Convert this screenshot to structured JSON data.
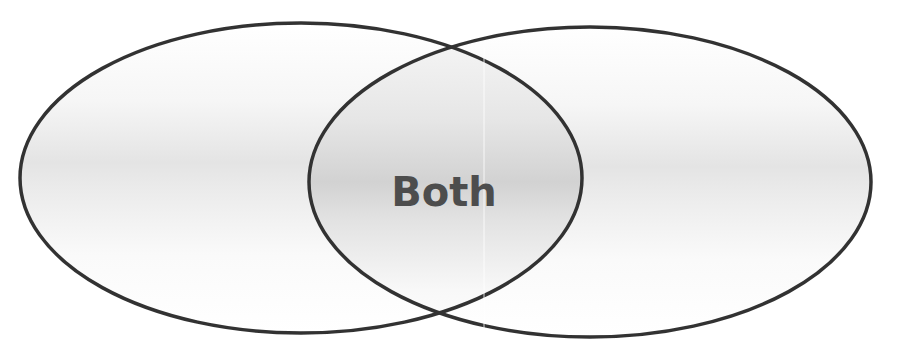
{
  "diagram": {
    "type": "venn",
    "sets": [
      {
        "name": "left-set",
        "label": ""
      },
      {
        "name": "right-set",
        "label": ""
      }
    ],
    "intersection_label": "Both"
  },
  "colors": {
    "stroke": "#333333",
    "fill_light": "#ffffff",
    "fill_band": "#dcdcdc",
    "text": "#4d4d4d"
  }
}
